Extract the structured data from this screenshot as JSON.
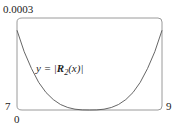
{
  "chart_data": {
    "type": "line",
    "title": "",
    "xlabel": "",
    "ylabel": "",
    "xlim": [
      7,
      9
    ],
    "ylim": [
      0,
      0.0003
    ],
    "x_tick_labels": [
      "7",
      "9"
    ],
    "y_tick_labels": [
      "0",
      "0.0003"
    ],
    "grid": false,
    "annotation": "y = |R2(x)|",
    "series": [
      {
        "name": "y = |R2(x)|",
        "x": [
          7.0,
          7.1,
          7.2,
          7.3,
          7.4,
          7.5,
          7.6,
          7.7,
          7.8,
          7.9,
          8.0,
          8.1,
          8.2,
          8.3,
          8.4,
          8.5,
          8.6,
          8.7,
          8.8,
          8.9,
          9.0
        ],
        "values": [
          0.00026,
          0.00019,
          0.000135,
          9e-05,
          5.7e-05,
          3.4e-05,
          1.8e-05,
          8e-06,
          2.5e-06,
          3e-07,
          0.0,
          3e-07,
          2.5e-06,
          8e-06,
          1.8e-05,
          3.4e-05,
          5.7e-05,
          9e-05,
          0.000135,
          0.00019,
          0.00026
        ]
      }
    ]
  },
  "labels": {
    "y_max": "0.0003",
    "y_min": "0",
    "x_min": "7",
    "x_max": "9",
    "equation_prefix": "y = |",
    "equation_R": "R",
    "equation_sub": "2",
    "equation_suffix": "(x)|"
  }
}
